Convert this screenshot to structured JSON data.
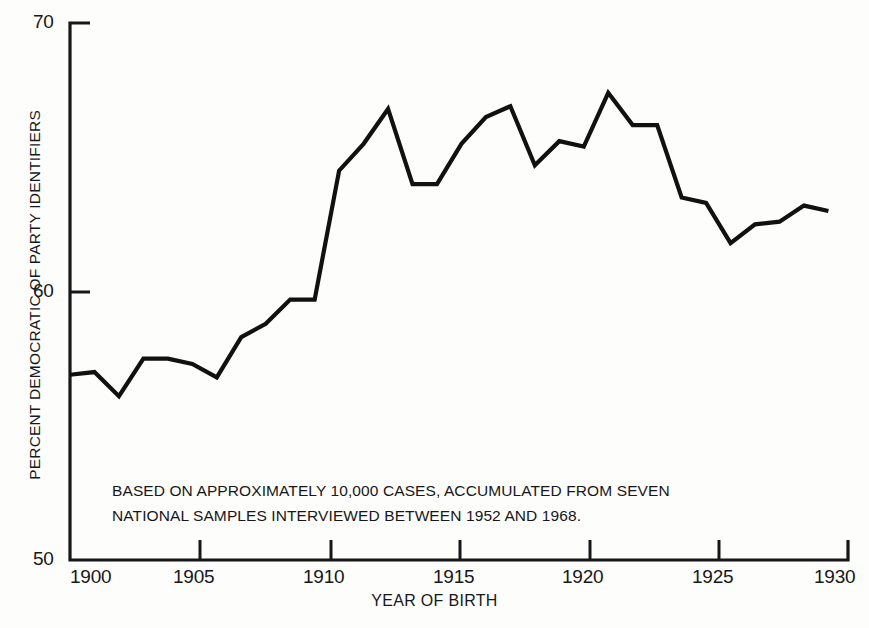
{
  "chart_data": {
    "type": "line",
    "title": "",
    "xlabel": "YEAR OF BIRTH",
    "ylabel": "PERCENT DEMOCRATIC OF PARTY IDENTIFIERS",
    "xlim": [
      1899,
      1930.8
    ],
    "ylim": [
      50,
      70
    ],
    "xticks": [
      1900,
      1905,
      1910,
      1915,
      1920,
      1925,
      1930
    ],
    "xtick_labels": [
      "1900",
      "1905",
      "1910",
      "1915",
      "1920",
      "1925",
      "1930"
    ],
    "yticks": [
      50,
      60,
      70
    ],
    "ytick_labels": [
      "50",
      "60",
      "70"
    ],
    "grid": false,
    "legend": "none",
    "line_color": "#111111",
    "background_color": "#fdfdfb",
    "annotations": [
      "BASED ON APPROXIMATELY 10,000 CASES, ACCUMULATED FROM SEVEN",
      "NATIONAL SAMPLES INTERVIEWED BETWEEN  1952 AND 1968."
    ],
    "x": [
      1899,
      1900,
      1901,
      1902,
      1903,
      1904,
      1905,
      1906,
      1907,
      1908,
      1909,
      1910,
      1911,
      1912,
      1913,
      1914,
      1915,
      1916,
      1917,
      1918,
      1919,
      1920,
      1921,
      1922,
      1923,
      1924,
      1925,
      1926,
      1927,
      1928,
      1929,
      1930
    ],
    "values": [
      56.9,
      57.0,
      56.1,
      57.5,
      57.5,
      57.3,
      56.8,
      58.3,
      58.8,
      59.7,
      59.7,
      64.5,
      65.5,
      66.8,
      64.0,
      64.0,
      65.5,
      66.5,
      66.9,
      64.7,
      65.6,
      65.4,
      67.4,
      66.2,
      66.2,
      63.5,
      63.3,
      61.8,
      62.5,
      62.6,
      63.2,
      63.0
    ],
    "series": [
      {
        "name": "Percent Democratic of party identifiers",
        "values": [
          56.9,
          57.0,
          56.1,
          57.5,
          57.5,
          57.3,
          56.8,
          58.3,
          58.8,
          59.7,
          59.7,
          64.5,
          65.5,
          66.8,
          64.0,
          64.0,
          65.5,
          66.5,
          66.9,
          64.7,
          65.6,
          65.4,
          67.4,
          66.2,
          66.2,
          63.5,
          63.3,
          61.8,
          62.5,
          62.6,
          63.2,
          63.0
        ]
      }
    ]
  },
  "axis": {
    "y_title": "PERCENT DEMOCRATIC OF PARTY IDENTIFIERS",
    "x_title": "YEAR OF BIRTH",
    "y_top": "70",
    "y_mid": "60",
    "y_bottom": "50",
    "x_ticks": [
      "1900",
      "1905",
      "1910",
      "1915",
      "1920",
      "1925",
      "1930"
    ]
  },
  "note": {
    "line1": "BASED ON APPROXIMATELY 10,000 CASES, ACCUMULATED FROM SEVEN",
    "line2": "NATIONAL SAMPLES INTERVIEWED BETWEEN  1952 AND 1968."
  }
}
